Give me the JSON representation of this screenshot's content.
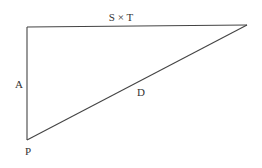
{
  "diagram": {
    "type": "right-triangle",
    "vertices": {
      "top_left": [
        27,
        27
      ],
      "top_right": [
        247,
        25
      ],
      "bottom_left": [
        27,
        140
      ]
    },
    "edges": [
      {
        "name": "top-edge",
        "label": "S × T",
        "from": "top_left",
        "to": "top_right"
      },
      {
        "name": "left-edge",
        "label": "A",
        "from": "top_left",
        "to": "bottom_left"
      },
      {
        "name": "hypotenuse",
        "label": "D",
        "from": "bottom_left",
        "to": "top_right"
      }
    ],
    "labels": {
      "top": "S × T",
      "left": "A",
      "hypotenuse": "D",
      "vertex_bottom_left": "P"
    },
    "line_color": "#444444",
    "text_color": "#333333"
  }
}
